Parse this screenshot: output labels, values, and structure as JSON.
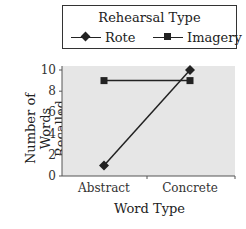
{
  "chart_data": {
    "type": "line",
    "title": "",
    "categories": [
      "Abstract",
      "Concrete"
    ],
    "series": [
      {
        "name": "Rote",
        "marker": "diamond",
        "values": [
          1,
          10
        ]
      },
      {
        "name": "Imagery",
        "marker": "square",
        "values": [
          9,
          9
        ]
      }
    ],
    "xlabel": "Word Type",
    "ylabel": "Number of Words Recalled",
    "ylabel_lines": [
      "Number of Words",
      "Recalled"
    ],
    "ylim": [
      0,
      10
    ],
    "yticks": [
      "0",
      "2",
      "4",
      "6",
      "8",
      "10"
    ],
    "grid": false,
    "legend": {
      "title": "Rehearsal Type",
      "position": "top"
    },
    "plot_background": "#e6e6e6"
  }
}
